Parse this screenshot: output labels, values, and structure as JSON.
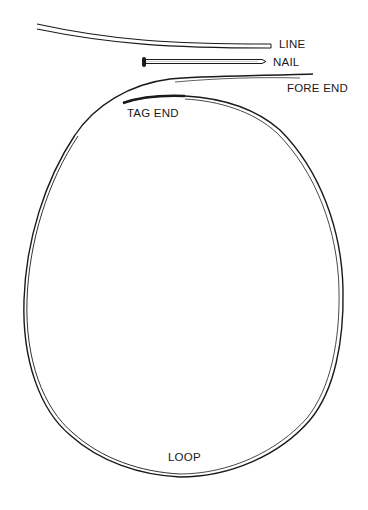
{
  "diagram": {
    "title": "",
    "labels": {
      "line": "LINE",
      "nail": "NAIL",
      "fore_end": "FORE END",
      "tag_end": "TAG END",
      "loop": "LOOP"
    },
    "colors": {
      "stroke": "#1a1a1a",
      "background": "#ffffff"
    }
  }
}
